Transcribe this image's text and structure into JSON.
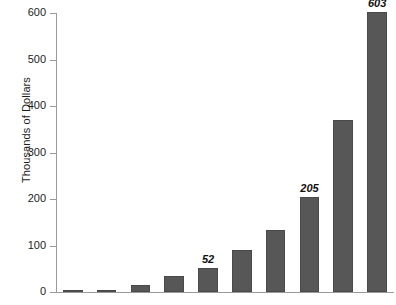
{
  "chart_data": {
    "type": "bar",
    "title": "",
    "xlabel": "",
    "ylabel": "Thousands of Dollars",
    "ylim": [
      0,
      600
    ],
    "yticks": [
      0,
      100,
      200,
      300,
      400,
      500,
      600
    ],
    "ytick_labels": [
      "0",
      "100",
      "200",
      "300",
      "400",
      "500",
      "600"
    ],
    "grid": false,
    "legend": false,
    "categories": [
      "1",
      "2",
      "3",
      "4",
      "5",
      "6",
      "7",
      "8",
      "9",
      "10",
      "11"
    ],
    "values": [
      2,
      5,
      16,
      34,
      52,
      90,
      133,
      205,
      370,
      603,
      603
    ],
    "bars": [
      {
        "value": 2,
        "label": ""
      },
      {
        "value": 5,
        "label": ""
      },
      {
        "value": 16,
        "label": ""
      },
      {
        "value": 34,
        "label": ""
      },
      {
        "value": 52,
        "label": "52"
      },
      {
        "value": 90,
        "label": ""
      },
      {
        "value": 133,
        "label": ""
      },
      {
        "value": 205,
        "label": "205"
      },
      {
        "value": 370,
        "label": ""
      },
      {
        "value": 603,
        "label": "603"
      }
    ],
    "bar_color": "#575757",
    "axis_color": "#9a9a9a",
    "text_color": "#1d1d1d",
    "annotations": [
      "52",
      "205",
      "603"
    ]
  }
}
